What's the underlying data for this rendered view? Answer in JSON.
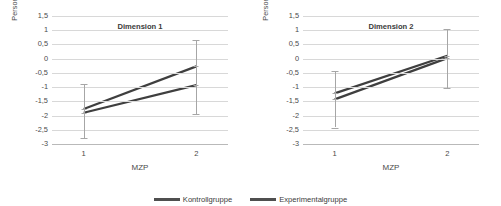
{
  "chart_data": [
    {
      "type": "line",
      "title": "Dimension 1",
      "xlabel": "MZP",
      "ylabel": "Personenparameter",
      "x": [
        "1",
        "2"
      ],
      "categories": [
        "1",
        "2"
      ],
      "yticks": [
        "1,5",
        "1",
        "0,5",
        "0",
        "-0,5",
        "-1",
        "-1,5",
        "-2",
        "-2,5",
        "-3"
      ],
      "ytickvalues": [
        1.5,
        1.0,
        0.5,
        0.0,
        -0.5,
        -1.0,
        -1.5,
        -2.0,
        -2.5,
        -3.0
      ],
      "ylim": [
        -3,
        1.5
      ],
      "grid": true,
      "legend_position": "bottom-center",
      "series": [
        {
          "name": "Kontrollgruppe",
          "values": [
            -1.9,
            -0.93
          ],
          "errors_low": [
            -2.8,
            -1.95
          ],
          "errors_high": [
            -0.88,
            0.08
          ]
        },
        {
          "name": "Experimentalgruppe",
          "values": [
            -1.77,
            -0.27
          ],
          "errors_low": [
            -2.8,
            -1.95
          ],
          "errors_high": [
            -0.88,
            0.67
          ]
        }
      ]
    },
    {
      "type": "line",
      "title": "Dimension 2",
      "xlabel": "MZP",
      "ylabel": "Personenparameter",
      "x": [
        "1",
        "2"
      ],
      "categories": [
        "1",
        "2"
      ],
      "yticks": [
        "1,5",
        "1",
        "0,5",
        "0",
        "-0,5",
        "-1",
        "-1,5",
        "-2",
        "-2,5",
        "-3"
      ],
      "ytickvalues": [
        1.5,
        1.0,
        0.5,
        0.0,
        -0.5,
        -1.0,
        -1.5,
        -2.0,
        -2.5,
        -3.0
      ],
      "ylim": [
        -3,
        1.5
      ],
      "grid": true,
      "legend_position": "bottom-center",
      "series": [
        {
          "name": "Kontrollgruppe",
          "values": [
            -1.43,
            0.02
          ],
          "errors_low": [
            -2.42,
            -1.02
          ],
          "errors_high": [
            -0.45,
            1.05
          ]
        },
        {
          "name": "Experimentalgruppe",
          "values": [
            -1.22,
            0.1
          ],
          "errors_low": [
            -2.42,
            -1.02
          ],
          "errors_high": [
            -0.45,
            1.05
          ]
        }
      ]
    }
  ],
  "legend": {
    "items": [
      {
        "label": "Kontrollgruppe",
        "color": "#4f4f4f"
      },
      {
        "label": "Experimentalgruppe",
        "color": "#4f4f4f"
      }
    ]
  },
  "colors": {
    "line": "#3f3f3f",
    "error": "#a6a6a6",
    "grid": "#d8d8d8",
    "text": "#4a4a4a",
    "background": "#ffffff"
  }
}
